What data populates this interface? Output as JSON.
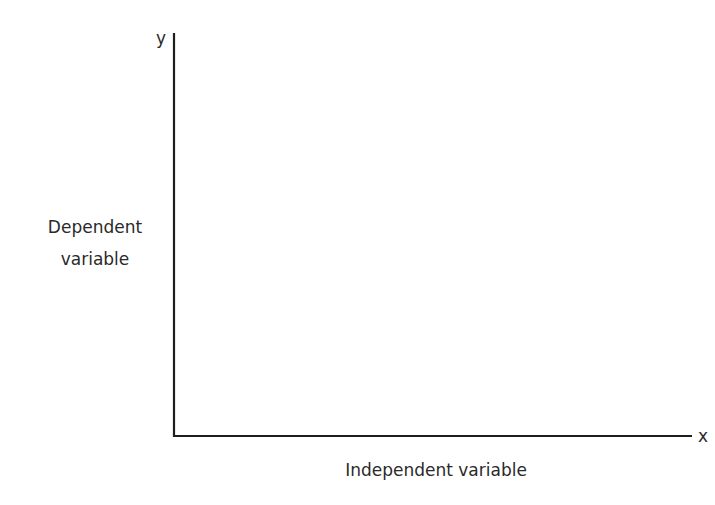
{
  "diagram": {
    "type": "empty-axes",
    "x_axis": {
      "symbol": "x",
      "label": "Independent variable"
    },
    "y_axis": {
      "symbol": "y",
      "label_lines": [
        "Dependent",
        "variable"
      ]
    },
    "colors": {
      "axis": "#1e1e1e",
      "text": "#2a2a2a",
      "background": "#ffffff"
    }
  }
}
